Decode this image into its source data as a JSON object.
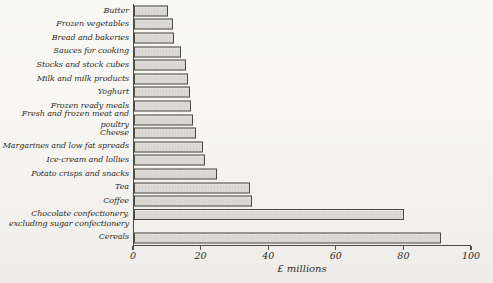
{
  "colors": {
    "paper": "#f7f6f2",
    "text": "#2f2c28",
    "axis": "#4f4d49",
    "bar_fill": "#dbdad6",
    "bar_dot": "#c8c7c2",
    "bar_border": "#4c4a45"
  },
  "chart_data": {
    "type": "bar",
    "orientation": "horizontal",
    "categories": [
      "Butter",
      "Frozen vegetables",
      "Bread and bakeries",
      "Sauces for cooking",
      "Stocks and stock cubes",
      "Milk and milk products",
      "Yoghurt",
      "Frozen ready meals",
      "Fresh and frozen meat and poultry",
      "Cheese",
      "Margarines and low fat spreads",
      "Ice-cream and lollies",
      "Potato crisps and snacks",
      "Tea",
      "Coffee",
      "Chocolate confectionery,\nexcluding sugar confectionery",
      "Cereals"
    ],
    "values": [
      10,
      11.5,
      12,
      14,
      15.5,
      16,
      16.5,
      17,
      17.5,
      18.5,
      20.5,
      21,
      24.5,
      34.5,
      35,
      80,
      91
    ],
    "xlabel": "£ millions",
    "xlim": [
      0,
      100
    ],
    "xticks": [
      0,
      20,
      40,
      60,
      80,
      100
    ],
    "grid": false,
    "legend": false
  }
}
